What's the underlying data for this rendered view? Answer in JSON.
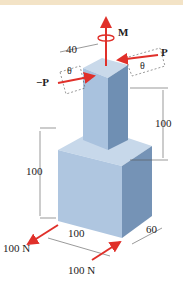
{
  "figure": {
    "colors": {
      "top_band": "#f3e3c6",
      "force_arrow": "#e0302a",
      "block_light": "#bcd0e6",
      "block_mid": "#a9c2de",
      "block_dark": "#6f8fb3",
      "dim_line": "#555555"
    },
    "labels": {
      "moment": "M",
      "force_right": "P",
      "force_left": "−P",
      "theta_left": "θ",
      "theta_right": "θ",
      "dim_top_width": "40",
      "dim_upper_height": "100",
      "dim_lower_height": "100",
      "dim_base_width": "100",
      "dim_base_depth": "60",
      "force_bottom_left": "100 N",
      "force_bottom_right": "100 N"
    }
  }
}
